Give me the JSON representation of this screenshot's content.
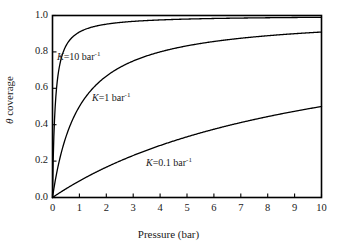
{
  "chart_data": {
    "type": "line",
    "title": "",
    "xlabel": "Pressure (bar)",
    "ylabel": "θ coverage",
    "xlim": [
      0,
      10
    ],
    "ylim": [
      0,
      1.0
    ],
    "grid": false,
    "legend_position": "inline-annotations",
    "x_ticks": [
      "0",
      "1",
      "2",
      "3",
      "4",
      "5",
      "6",
      "7",
      "8",
      "9",
      "10"
    ],
    "y_ticks": [
      "0.0",
      "0.2",
      "0.4",
      "0.6",
      "0.8",
      "1.0"
    ],
    "x_tick_values": [
      0,
      1,
      2,
      3,
      4,
      5,
      6,
      7,
      8,
      9,
      10
    ],
    "y_tick_values": [
      0.0,
      0.2,
      0.4,
      0.6,
      0.8,
      1.0
    ],
    "equation": "theta = K*P/(1+K*P)",
    "series": [
      {
        "name": "K=10 bar-1",
        "K": 10,
        "x": [
          0,
          0.05,
          0.1,
          0.2,
          0.3,
          0.4,
          0.5,
          0.75,
          1,
          1.5,
          2,
          2.5,
          3,
          4,
          5,
          6,
          7,
          8,
          9,
          10
        ],
        "values": [
          0,
          0.3333,
          0.5,
          0.6667,
          0.75,
          0.8,
          0.8333,
          0.8824,
          0.9091,
          0.9375,
          0.9524,
          0.9615,
          0.9677,
          0.9756,
          0.9804,
          0.9836,
          0.9859,
          0.9877,
          0.989,
          0.9901
        ]
      },
      {
        "name": "K=1 bar-1",
        "K": 1,
        "x": [
          0,
          0.25,
          0.5,
          0.75,
          1,
          1.5,
          2,
          2.5,
          3,
          4,
          5,
          6,
          7,
          8,
          9,
          10
        ],
        "values": [
          0,
          0.2,
          0.3333,
          0.4286,
          0.5,
          0.6,
          0.6667,
          0.7143,
          0.75,
          0.8,
          0.8333,
          0.8571,
          0.875,
          0.8889,
          0.9,
          0.9091
        ]
      },
      {
        "name": "K=0.1 bar-1",
        "K": 0.1,
        "x": [
          0,
          0.5,
          1,
          1.5,
          2,
          2.5,
          3,
          4,
          5,
          6,
          7,
          8,
          9,
          10
        ],
        "values": [
          0,
          0.0476,
          0.0909,
          0.1304,
          0.1667,
          0.2,
          0.2308,
          0.2857,
          0.3333,
          0.375,
          0.4118,
          0.4444,
          0.4737,
          0.5
        ]
      }
    ],
    "annotations": [
      {
        "label_k": "K",
        "label_eq": "=10 bar",
        "label_sup": "-1",
        "x_px": 57,
        "y_px": 51
      },
      {
        "label_k": "K",
        "label_eq": "=1 bar",
        "label_sup": "-1",
        "x_px": 92,
        "y_px": 92
      },
      {
        "label_k": "K",
        "label_eq": "=0.1 bar",
        "label_sup": "-1",
        "x_px": 146,
        "y_px": 157
      }
    ]
  },
  "colors": {
    "curve": "#000000",
    "axis": "#000000",
    "text": "#1a1a1a",
    "background": "#ffffff"
  },
  "axis_labels": {
    "x_title": "Pressure (bar)",
    "y_title_symbol": "θ",
    "y_title_text": " coverage"
  }
}
